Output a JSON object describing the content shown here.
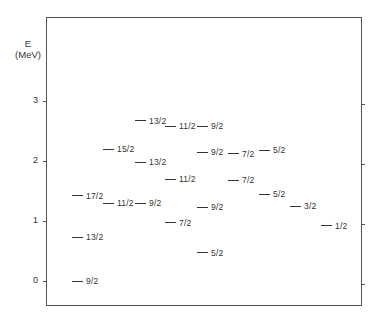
{
  "chart_data": {
    "type": "scatter",
    "subtype": "energy-level-diagram",
    "title": "",
    "xlabel": "",
    "ylabel": "E (MeV)",
    "ylabel_lines": [
      "E",
      "(MeV)"
    ],
    "ylim": [
      -0.4,
      4.4
    ],
    "yticks": [
      0,
      1,
      2,
      3
    ],
    "ytick_labels": [
      "0",
      "1",
      "2",
      "3"
    ],
    "grid": false,
    "legend": null,
    "levels": [
      {
        "column": 1,
        "spin": "9/2",
        "energy": 0.0
      },
      {
        "column": 1,
        "spin": "13/2",
        "energy": 0.73
      },
      {
        "column": 1,
        "spin": "17/2",
        "energy": 1.42
      },
      {
        "column": 2,
        "spin": "11/2",
        "energy": 1.3
      },
      {
        "column": 2,
        "spin": "15/2",
        "energy": 2.2
      },
      {
        "column": 3,
        "spin": "9/2",
        "energy": 1.3
      },
      {
        "column": 3,
        "spin": "13/2",
        "energy": 1.98
      },
      {
        "column": 3,
        "spin": "13/2",
        "energy": 2.67
      },
      {
        "column": 4,
        "spin": "7/2",
        "energy": 0.97
      },
      {
        "column": 4,
        "spin": "11/2",
        "energy": 1.7
      },
      {
        "column": 4,
        "spin": "11/2",
        "energy": 2.58
      },
      {
        "column": 5,
        "spin": "5/2",
        "energy": 0.47
      },
      {
        "column": 5,
        "spin": "9/2",
        "energy": 1.23
      },
      {
        "column": 5,
        "spin": "9/2",
        "energy": 2.15
      },
      {
        "column": 5,
        "spin": "9/2",
        "energy": 2.58
      },
      {
        "column": 6,
        "spin": "7/2",
        "energy": 1.68
      },
      {
        "column": 6,
        "spin": "7/2",
        "energy": 2.12
      },
      {
        "column": 7,
        "spin": "5/2",
        "energy": 1.45
      },
      {
        "column": 7,
        "spin": "5/2",
        "energy": 2.18
      },
      {
        "column": 8,
        "spin": "3/2",
        "energy": 1.25
      },
      {
        "column": 9,
        "spin": "1/2",
        "energy": 0.92
      }
    ]
  },
  "axis": {
    "ylabel_top": "E",
    "ylabel_bottom": "(MeV)",
    "tick_labels": [
      "3",
      "2",
      "1",
      "0"
    ]
  },
  "colors": {
    "ink": "#333333",
    "frame": "#555555",
    "background": "#ffffff"
  }
}
